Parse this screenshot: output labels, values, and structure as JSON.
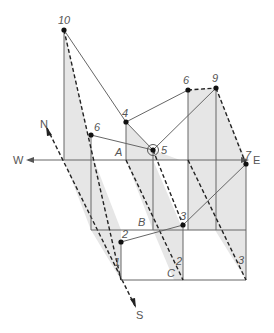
{
  "diagram": {
    "type": "3D block diagram of a surface projected onto a vertical-section grid",
    "compass": {
      "north": "N",
      "south": "S",
      "west": "W",
      "east": "E"
    },
    "points": [
      {
        "id": "p10",
        "label": "10",
        "x": 64,
        "y": 30
      },
      {
        "id": "p6a",
        "label": "6",
        "x": 91,
        "y": 135
      },
      {
        "id": "p4",
        "label": "4",
        "x": 126,
        "y": 122
      },
      {
        "id": "p5",
        "label": "5",
        "x": 153,
        "y": 150
      },
      {
        "id": "p6b",
        "label": "6",
        "x": 188,
        "y": 90
      },
      {
        "id": "p9",
        "label": "9",
        "x": 216,
        "y": 88
      },
      {
        "id": "p7",
        "label": "7",
        "x": 246,
        "y": 164
      },
      {
        "id": "p3a",
        "label": "3",
        "x": 183,
        "y": 225
      },
      {
        "id": "p2",
        "label": "2",
        "x": 121,
        "y": 242
      }
    ],
    "grid_labels": [
      {
        "id": "A",
        "label": "A"
      },
      {
        "id": "B",
        "label": "B"
      },
      {
        "id": "C",
        "label": "C"
      },
      {
        "id": "edge1",
        "label": "1"
      },
      {
        "id": "edge2",
        "label": "2"
      },
      {
        "id": "edge3",
        "label": "3"
      }
    ],
    "colors": {
      "line": "#666666",
      "dashed": "#222222",
      "shade": "#e6e6e6",
      "text": "#555555"
    }
  }
}
